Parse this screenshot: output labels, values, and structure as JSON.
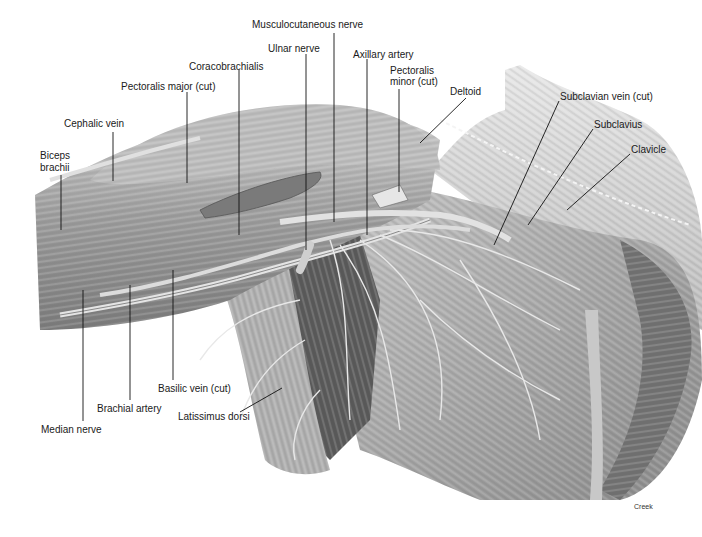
{
  "figure": {
    "credit": "Creek",
    "colors": {
      "background": "#ffffff",
      "label_text": "#1a1a1a",
      "leader_line": "#111111",
      "muscle_dark": "#6e6e6e",
      "muscle_mid": "#a8a8a8",
      "muscle_light": "#d9d9d9"
    }
  },
  "labels": [
    {
      "id": "musculocutaneous-nerve",
      "text": "Musculocutaneous nerve",
      "x": 252,
      "y": 25
    },
    {
      "id": "ulnar-nerve",
      "text": "Ulnar nerve",
      "x": 268,
      "y": 43
    },
    {
      "id": "axillary-artery",
      "text": "Axillary artery",
      "x": 353,
      "y": 49
    },
    {
      "id": "coracobrachialis",
      "text": "Coracobrachialis",
      "x": 189,
      "y": 61
    },
    {
      "id": "pectoralis-minor-cut-line1",
      "text": "Pectoralis",
      "x": 390,
      "y": 65
    },
    {
      "id": "pectoralis-minor-cut-line2",
      "text": "minor (cut)",
      "x": 390,
      "y": 76
    },
    {
      "id": "pectoralis-major-cut",
      "text": "Pectoralis major (cut)",
      "x": 121,
      "y": 81
    },
    {
      "id": "deltoid",
      "text": "Deltoid",
      "x": 450,
      "y": 86
    },
    {
      "id": "subclavian-vein-cut",
      "text": "Subclavian vein (cut)",
      "x": 560,
      "y": 91
    },
    {
      "id": "cephalic-vein",
      "text": "Cephalic vein",
      "x": 64,
      "y": 118
    },
    {
      "id": "subclavius",
      "text": "Subclavius",
      "x": 594,
      "y": 119
    },
    {
      "id": "clavicle",
      "text": "Clavicle",
      "x": 631,
      "y": 144
    },
    {
      "id": "biceps-brachii-line1",
      "text": "Biceps",
      "x": 40,
      "y": 150
    },
    {
      "id": "biceps-brachii-line2",
      "text": "brachii",
      "x": 40,
      "y": 162
    },
    {
      "id": "basilic-vein-cut",
      "text": "Basilic vein (cut)",
      "x": 158,
      "y": 383
    },
    {
      "id": "brachial-artery",
      "text": "Brachial artery",
      "x": 97,
      "y": 403
    },
    {
      "id": "latissimus-dorsi",
      "text": "Latissimus dorsi",
      "x": 178,
      "y": 411
    },
    {
      "id": "median-nerve",
      "text": "Median nerve",
      "x": 41,
      "y": 424
    }
  ]
}
